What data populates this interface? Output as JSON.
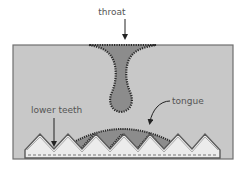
{
  "diagram": {
    "labels": {
      "throat": "throat",
      "tongue": "tongue",
      "lower_teeth": "lower teeth"
    },
    "colors": {
      "page_background": "#ffffff",
      "cavity_fill": "#c8c8c8",
      "cavity_border": "#6f6f6f",
      "throat_fill": "#8c8c8c",
      "tongue_fill": "#8c8c8c",
      "teeth_fill": "#ececec",
      "outline": "#2a2a2a",
      "label_text": "#555555"
    }
  }
}
